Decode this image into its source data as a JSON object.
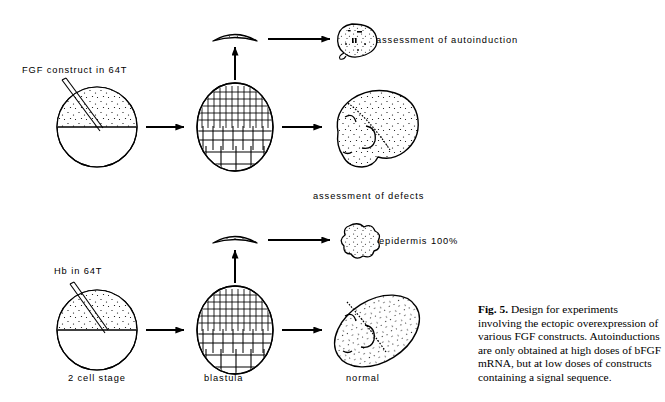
{
  "figure": {
    "id": "fig-5",
    "caption_label": "Fig. 5.",
    "caption_text": " Design for experiments involving the ectopic overexpression of various FGF constructs. Autoinductions are only obtained at high doses of bFGF mRNA, but at low doses of constructs containing a signal sequence.",
    "ink_color": "#000000",
    "background_color": "#ffffff"
  },
  "rows": {
    "top": {
      "injection_label": "FGF construct in 64T",
      "cap_outcome_label": "assessment of autoinduction",
      "embryo_outcome_label": "assessment of defects",
      "stage_labels": {
        "egg": "",
        "blastula": "",
        "embryo": ""
      }
    },
    "bottom": {
      "injection_label": "Hb in 64T",
      "cap_outcome_label": "epidermis 100%",
      "embryo_outcome_label": "",
      "stage_labels": {
        "egg": "2 cell stage",
        "blastula": "blastula",
        "embryo": "normal"
      }
    }
  },
  "icons": {
    "egg": "two-cell-egg-icon",
    "needle": "injection-needle-icon",
    "blastula": "blastula-icon",
    "animal_cap": "animal-cap-icon",
    "tadpole": "tadpole-embryo-icon",
    "autoinduction_blob": "autoinduction-explant-icon",
    "epidermis_blob": "epidermis-explant-icon",
    "arrow_right": "arrow-right-icon",
    "arrow_up": "arrow-up-icon"
  }
}
